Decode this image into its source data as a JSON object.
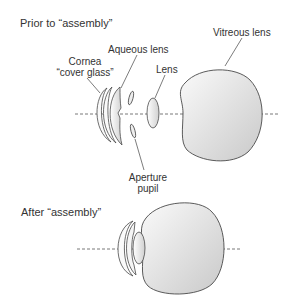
{
  "top_panel": {
    "title": "Prior to “assembly”",
    "labels": {
      "cornea_line1": "Cornea",
      "cornea_line2": "“cover glass”",
      "aqueous": "Aqueous lens",
      "lens": "Lens",
      "vitreous": "Vitreous lens",
      "aperture_line1": "Aperture",
      "aperture_line2": "pupil"
    }
  },
  "bottom_panel": {
    "title": "After “assembly”"
  },
  "colors": {
    "stroke": "#4a4a4a",
    "fill_light": "#f4f4f4",
    "fill_dark": "#cfcfcf",
    "axis": "#555555"
  }
}
